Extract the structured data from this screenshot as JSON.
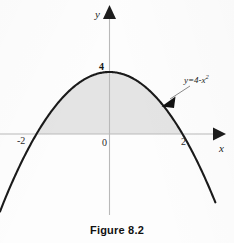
{
  "figure": {
    "caption": "Figure 8.2",
    "background_color": "#fdfdfd",
    "curve_color": "#1a1a1a",
    "axis_color": "#b5b5b5",
    "shade_color": "#e4e4e4"
  },
  "axes": {
    "x_axis_label": "x",
    "y_axis_label": "y",
    "origin_label": "0",
    "x_ticks": [
      "-2",
      "2"
    ],
    "y_ticks": [
      "4"
    ],
    "x_tick_left": "-2",
    "x_tick_right": "2",
    "y_tick_top": "4"
  },
  "annotations": {
    "curve_label_prefix": "y=4-x",
    "curve_label_exponent": "2",
    "curve_label_full": "y=4-x²"
  },
  "chart_data": {
    "type": "line",
    "title": "Figure 8.2",
    "xlabel": "x",
    "ylabel": "y",
    "equation": "y = 4 - x^2",
    "xlim": [
      -3.0,
      2.9
    ],
    "ylim": [
      -4.2,
      4.6
    ],
    "xticks": [
      -2,
      0,
      2
    ],
    "xticklabels": [
      "-2",
      "0",
      "2"
    ],
    "yticks": [
      4
    ],
    "yticklabels": [
      "4"
    ],
    "grid": false,
    "legend": false,
    "shaded_region": {
      "label": "area under y=4-x² from x=-2 to x=2",
      "x_from": -2,
      "x_to": 2,
      "baseline_y": 0,
      "fill": "#e4e4e4"
    },
    "series": [
      {
        "name": "y=4-x²",
        "x": [
          -3.0,
          -2.8,
          -2.6,
          -2.4,
          -2.2,
          -2.0,
          -1.8,
          -1.6,
          -1.4,
          -1.2,
          -1.0,
          -0.8,
          -0.6,
          -0.4,
          -0.2,
          0.0,
          0.2,
          0.4,
          0.6,
          0.8,
          1.0,
          1.2,
          1.4,
          1.6,
          1.8,
          2.0,
          2.2,
          2.4,
          2.6,
          2.8,
          2.9
        ],
        "values": [
          -5.0,
          -3.84,
          -2.76,
          -1.76,
          -0.84,
          0.0,
          0.76,
          1.44,
          2.04,
          2.56,
          3.0,
          3.36,
          3.64,
          3.84,
          3.96,
          4.0,
          3.96,
          3.84,
          3.64,
          3.36,
          3.0,
          2.56,
          2.04,
          1.44,
          0.76,
          0.0,
          -0.84,
          -1.76,
          -2.76,
          -3.84,
          -4.41
        ]
      }
    ],
    "annotations": [
      {
        "text": "y=4-x²",
        "points_to_x": 1.45,
        "points_to_y": 1.9
      }
    ]
  }
}
